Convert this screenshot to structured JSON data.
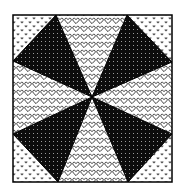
{
  "figure": {
    "box": {
      "x1": 13,
      "y1": 15,
      "x2": 172,
      "y2": 182
    },
    "center": {
      "x": 92,
      "y": 97
    },
    "colors": {
      "background": "#ffffff",
      "border": "#000000",
      "dark_wedge": "#0c0c0c",
      "dot": "#ffffff",
      "pattern_ink": "#111111"
    },
    "patterns": {
      "corner_fill": "small-solid-hearts",
      "side_fill": "outline-hearts",
      "wedge_fill": "black-with-white-dots"
    },
    "wedges": [
      {
        "name": "top-left-dark-wedge",
        "points": [
          [
            56,
            15
          ],
          [
            13,
            61
          ],
          [
            92,
            97
          ]
        ]
      },
      {
        "name": "top-right-dark-wedge",
        "points": [
          [
            127,
            15
          ],
          [
            172,
            62
          ],
          [
            92,
            97
          ]
        ]
      },
      {
        "name": "bottom-left-dark-wedge",
        "points": [
          [
            13,
            134
          ],
          [
            58,
            182
          ],
          [
            92,
            97
          ]
        ]
      },
      {
        "name": "bottom-right-dark-wedge",
        "points": [
          [
            172,
            134
          ],
          [
            128,
            182
          ],
          [
            92,
            97
          ]
        ]
      }
    ],
    "heart_regions": [
      {
        "name": "top-heart-region",
        "points": [
          [
            56,
            15
          ],
          [
            127,
            15
          ],
          [
            92,
            97
          ]
        ]
      },
      {
        "name": "right-heart-region",
        "points": [
          [
            172,
            62
          ],
          [
            172,
            134
          ],
          [
            92,
            97
          ]
        ]
      },
      {
        "name": "bottom-heart-region",
        "points": [
          [
            58,
            182
          ],
          [
            128,
            182
          ],
          [
            92,
            97
          ]
        ]
      },
      {
        "name": "left-heart-region",
        "points": [
          [
            13,
            61
          ],
          [
            13,
            134
          ],
          [
            92,
            97
          ]
        ]
      }
    ],
    "corner_regions": [
      {
        "name": "top-left-corner-region",
        "points": [
          [
            13,
            15
          ],
          [
            56,
            15
          ],
          [
            13,
            61
          ]
        ]
      },
      {
        "name": "top-right-corner-region",
        "points": [
          [
            127,
            15
          ],
          [
            172,
            15
          ],
          [
            172,
            62
          ]
        ]
      },
      {
        "name": "bottom-left-corner-region",
        "points": [
          [
            13,
            134
          ],
          [
            13,
            182
          ],
          [
            58,
            182
          ]
        ]
      },
      {
        "name": "bottom-right-corner-region",
        "points": [
          [
            172,
            134
          ],
          [
            172,
            182
          ],
          [
            128,
            182
          ]
        ]
      }
    ]
  }
}
